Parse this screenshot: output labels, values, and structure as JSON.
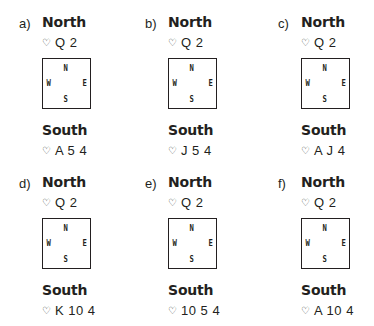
{
  "deals": [
    {
      "label": "a)",
      "north_title": "North",
      "north_suit": "♡",
      "north_cards": "Q 2",
      "south_title": "South",
      "south_suit": "♡",
      "south_cards": "A 5 4",
      "compass": {
        "n": "N",
        "s": "S",
        "w": "W",
        "e": "E"
      }
    },
    {
      "label": "b)",
      "north_title": "North",
      "north_suit": "♡",
      "north_cards": "Q 2",
      "south_title": "South",
      "south_suit": "♡",
      "south_cards": "J 5 4",
      "compass": {
        "n": "N",
        "s": "S",
        "w": "W",
        "e": "E"
      }
    },
    {
      "label": "c)",
      "north_title": "North",
      "north_suit": "♡",
      "north_cards": "Q 2",
      "south_title": "South",
      "south_suit": "♡",
      "south_cards": "A J 4",
      "compass": {
        "n": "N",
        "s": "S",
        "w": "W",
        "e": "E"
      }
    },
    {
      "label": "d)",
      "north_title": "North",
      "north_suit": "♡",
      "north_cards": "Q 2",
      "south_title": "South",
      "south_suit": "♡",
      "south_cards": "K 10 4",
      "compass": {
        "n": "N",
        "s": "S",
        "w": "W",
        "e": "E"
      }
    },
    {
      "label": "e)",
      "north_title": "North",
      "north_suit": "♡",
      "north_cards": "Q 2",
      "south_title": "South",
      "south_suit": "♡",
      "south_cards": "10 5 4",
      "compass": {
        "n": "N",
        "s": "S",
        "w": "W",
        "e": "E"
      }
    },
    {
      "label": "f)",
      "north_title": "North",
      "north_suit": "♡",
      "north_cards": "Q 2",
      "south_title": "South",
      "south_suit": "♡",
      "south_cards": "A 10 4",
      "compass": {
        "n": "N",
        "s": "S",
        "w": "W",
        "e": "E"
      }
    }
  ]
}
